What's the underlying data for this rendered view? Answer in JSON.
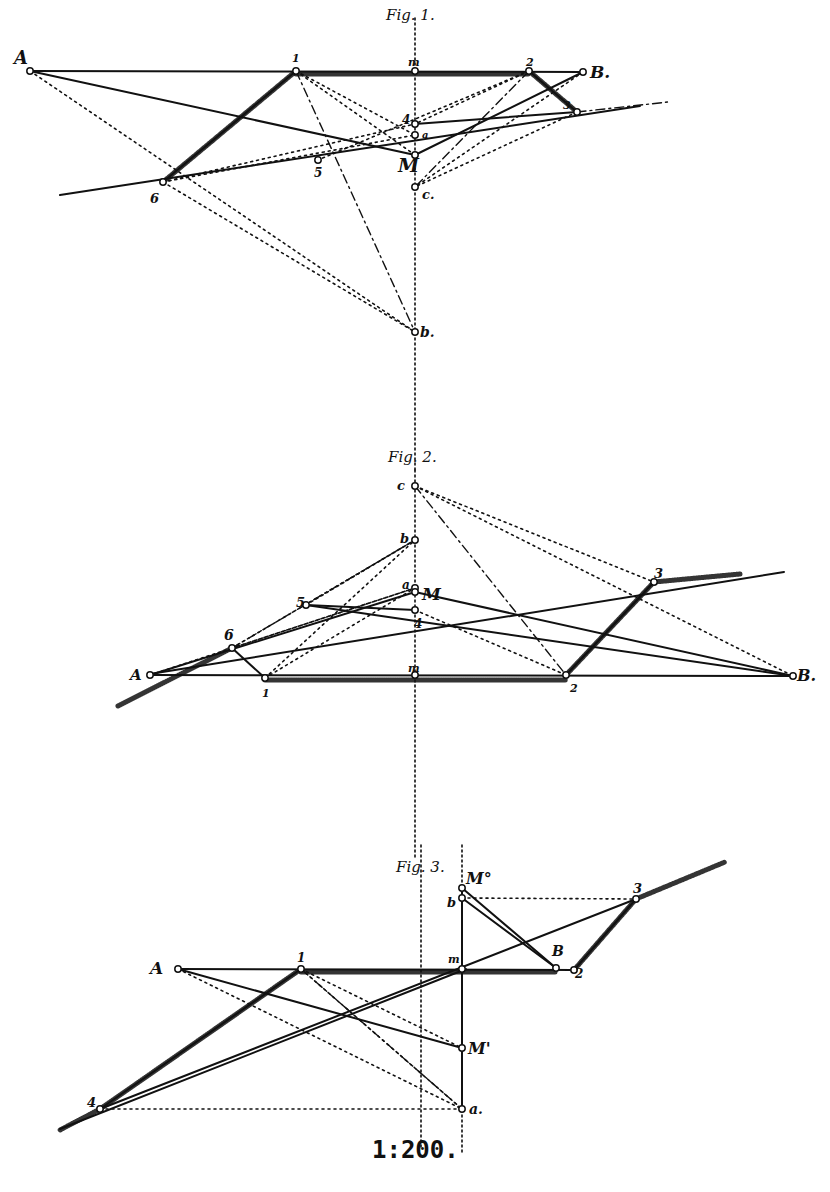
{
  "figures": [
    {
      "id": "fig1",
      "caption": "Fig. 1.",
      "caption_pos": [
        386,
        20
      ],
      "points": {
        "A": [
          30,
          71
        ],
        "1": [
          296,
          71
        ],
        "m": [
          415,
          71
        ],
        "2": [
          529,
          71
        ],
        "B": [
          583,
          72
        ],
        "3": [
          577,
          112
        ],
        "4": [
          415,
          124
        ],
        "a": [
          415,
          135
        ],
        "M": [
          415,
          155
        ],
        "5": [
          318,
          160
        ],
        "6": [
          163,
          182
        ],
        "c": [
          415,
          187
        ],
        "b": [
          415,
          332
        ]
      },
      "labels": [
        {
          "t": "A",
          "x": 14,
          "y": 64,
          "s": 18
        },
        {
          "t": "1",
          "x": 292,
          "y": 62,
          "s": 11
        },
        {
          "t": "m",
          "x": 408,
          "y": 66,
          "s": 11
        },
        {
          "t": "2",
          "x": 526,
          "y": 66,
          "s": 11
        },
        {
          "t": "B.",
          "x": 590,
          "y": 78,
          "s": 17
        },
        {
          "t": "3",
          "x": 563,
          "y": 109,
          "s": 11
        },
        {
          "t": "4",
          "x": 402,
          "y": 124,
          "s": 12
        },
        {
          "t": "a",
          "x": 422,
          "y": 138,
          "s": 10
        },
        {
          "t": "M",
          "x": 398,
          "y": 172,
          "s": 19
        },
        {
          "t": "5",
          "x": 314,
          "y": 177,
          "s": 12
        },
        {
          "t": "6",
          "x": 150,
          "y": 203,
          "s": 13
        },
        {
          "t": "c.",
          "x": 422,
          "y": 199,
          "s": 13
        },
        {
          "t": "b.",
          "x": 420,
          "y": 337,
          "s": 14
        }
      ],
      "solid": [
        [
          "A",
          "B"
        ],
        [
          "A",
          "M"
        ],
        [
          "M",
          "B"
        ],
        [
          [
            60,
            195
          ],
          [
            640,
            106
          ]
        ],
        [
          "1",
          "6"
        ],
        [
          "2",
          "3"
        ],
        [
          "4",
          "3"
        ]
      ],
      "hatched": [
        [
          "1",
          "6"
        ],
        [
          "2",
          "3"
        ],
        [
          [
            296,
            74
          ],
          [
            529,
            74
          ]
        ]
      ],
      "dashed": [
        [
          "A",
          "b"
        ],
        [
          "6",
          "b"
        ],
        [
          "1",
          "a"
        ],
        [
          "1",
          "M"
        ],
        [
          "2",
          "4"
        ],
        [
          "2",
          "5"
        ],
        [
          "3",
          "c"
        ],
        [
          "B",
          "c"
        ],
        [
          "6",
          "4"
        ],
        [
          "6",
          "a"
        ]
      ],
      "dashdot": [
        [
          "1",
          "b"
        ],
        [
          "2",
          "c"
        ],
        [
          [
            577,
            112
          ],
          [
            668,
            102
          ]
        ]
      ],
      "vertical_axis": [
        [
          415,
          18
        ],
        [
          415,
          470
        ]
      ]
    },
    {
      "id": "fig2",
      "caption": "Fig. 2.",
      "caption_pos": [
        388,
        462
      ],
      "points": {
        "c": [
          415,
          486
        ],
        "b": [
          415,
          540
        ],
        "a": [
          415,
          588
        ],
        "M": [
          415,
          592
        ],
        "4": [
          415,
          610
        ],
        "5": [
          306,
          605
        ],
        "3": [
          654,
          582
        ],
        "6": [
          232,
          648
        ],
        "A": [
          150,
          675
        ],
        "m": [
          415,
          675
        ],
        "1": [
          265,
          678
        ],
        "2": [
          566,
          675
        ],
        "B": [
          793,
          676
        ]
      },
      "labels": [
        {
          "t": "c",
          "x": 397,
          "y": 490,
          "s": 13
        },
        {
          "t": "b",
          "x": 400,
          "y": 543,
          "s": 13
        },
        {
          "t": "a",
          "x": 402,
          "y": 589,
          "s": 12
        },
        {
          "t": "M",
          "x": 422,
          "y": 600,
          "s": 17
        },
        {
          "t": "4",
          "x": 414,
          "y": 628,
          "s": 12
        },
        {
          "t": "5",
          "x": 296,
          "y": 607,
          "s": 13
        },
        {
          "t": "3",
          "x": 654,
          "y": 578,
          "s": 13
        },
        {
          "t": "6",
          "x": 224,
          "y": 640,
          "s": 14
        },
        {
          "t": "A",
          "x": 130,
          "y": 680,
          "s": 15
        },
        {
          "t": "m",
          "x": 408,
          "y": 672,
          "s": 11
        },
        {
          "t": "1",
          "x": 262,
          "y": 697,
          "s": 11
        },
        {
          "t": "2",
          "x": 570,
          "y": 692,
          "s": 11
        },
        {
          "t": "B.",
          "x": 797,
          "y": 681,
          "s": 16
        }
      ],
      "solid": [
        [
          "A",
          "B"
        ],
        [
          "A",
          "M"
        ],
        [
          "M",
          "B"
        ],
        [
          "5",
          "4"
        ],
        [
          [
            150,
            674
          ],
          [
            784,
            572
          ]
        ],
        [
          "6",
          "1"
        ],
        [
          "2",
          "3"
        ],
        [
          "5",
          "B"
        ]
      ],
      "hatched": [
        [
          [
            118,
            706
          ],
          [
            232,
            648
          ]
        ],
        [
          "2",
          "3"
        ],
        [
          [
            654,
            582
          ],
          [
            740,
            574
          ]
        ],
        [
          [
            265,
            680
          ],
          [
            566,
            680
          ]
        ]
      ],
      "dashed": [
        [
          "6",
          "b"
        ],
        [
          "6",
          "a"
        ],
        [
          "5",
          "b"
        ],
        [
          "4",
          "2"
        ],
        [
          "c",
          "3"
        ],
        [
          "c",
          "B"
        ],
        [
          "3",
          "2"
        ],
        [
          "1",
          "b"
        ],
        [
          "1",
          "a"
        ],
        [
          "A",
          "a"
        ]
      ],
      "dashdot": [
        [
          "c",
          "2"
        ],
        [
          "6",
          "b"
        ]
      ],
      "vertical_axis": [
        [
          415,
          470
        ],
        [
          415,
          860
        ]
      ]
    },
    {
      "id": "fig3",
      "caption": "Fig. 3.",
      "caption_pos": [
        396,
        872
      ],
      "points": {
        "M0": [
          462,
          888
        ],
        "b": [
          462,
          898
        ],
        "3": [
          636,
          899
        ],
        "B": [
          556,
          968
        ],
        "2": [
          574,
          970
        ],
        "A": [
          178,
          969
        ],
        "1": [
          301,
          969
        ],
        "m": [
          462,
          969
        ],
        "M1": [
          462,
          1048
        ],
        "a": [
          462,
          1109
        ],
        "4": [
          100,
          1109
        ]
      },
      "labels": [
        {
          "t": "M°",
          "x": 466,
          "y": 884,
          "s": 16
        },
        {
          "t": "b",
          "x": 447,
          "y": 907,
          "s": 13
        },
        {
          "t": "3",
          "x": 633,
          "y": 893,
          "s": 13
        },
        {
          "t": "B",
          "x": 552,
          "y": 956,
          "s": 14
        },
        {
          "t": "2",
          "x": 575,
          "y": 978,
          "s": 12
        },
        {
          "t": "A",
          "x": 150,
          "y": 974,
          "s": 17
        },
        {
          "t": "1",
          "x": 297,
          "y": 962,
          "s": 12
        },
        {
          "t": "m",
          "x": 448,
          "y": 963,
          "s": 11
        },
        {
          "t": "M'",
          "x": 468,
          "y": 1054,
          "s": 16
        },
        {
          "t": "a.",
          "x": 469,
          "y": 1114,
          "s": 14
        },
        {
          "t": "4",
          "x": 87,
          "y": 1107,
          "s": 13
        }
      ],
      "solid": [
        [
          "A",
          "2"
        ],
        [
          "A",
          "M1"
        ],
        [
          "M0",
          "a"
        ],
        [
          "M0",
          "B"
        ],
        [
          "b",
          "B"
        ],
        [
          [
            100,
            1109
          ],
          [
            636,
            899
          ]
        ],
        [
          "1",
          "4"
        ],
        [
          "2",
          "3"
        ],
        [
          [
            60,
            1129
          ],
          [
            466,
            969
          ]
        ]
      ],
      "hatched": [
        [
          "1",
          "4"
        ],
        [
          "2",
          "3"
        ],
        [
          [
            636,
            899
          ],
          [
            725,
            862
          ]
        ],
        [
          [
            301,
            972
          ],
          [
            556,
            972
          ]
        ],
        [
          [
            100,
            1109
          ],
          [
            60,
            1130
          ]
        ]
      ],
      "dashed": [
        [
          "b",
          "3"
        ],
        [
          "4",
          "a"
        ],
        [
          "1",
          "a"
        ],
        [
          "A",
          "a"
        ],
        [
          "1",
          "M1"
        ]
      ],
      "dashdot": [
        [
          "1",
          "a"
        ]
      ],
      "vertical_axis": [
        [
          421,
          845
        ],
        [
          421,
          1148
        ]
      ],
      "vertical_axis_2": [
        [
          462,
          845
        ],
        [
          462,
          1155
        ]
      ]
    }
  ],
  "scale_label": "1:200.",
  "scale_pos": [
    372,
    1158
  ],
  "colors": {
    "ink": "#111111",
    "paper": "#ffffff"
  }
}
